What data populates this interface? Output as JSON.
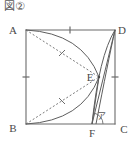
{
  "figure": {
    "caption": "図②",
    "shape": "square",
    "stroke_color": "#6b6b6b",
    "label_color": "#4a4a4a",
    "background": "#ffffff",
    "vertices": [
      {
        "name": "A",
        "label": "A",
        "x": 26,
        "y": 30,
        "label_x": 13,
        "label_y": 32
      },
      {
        "name": "D",
        "label": "D",
        "x": 115,
        "y": 30,
        "label_x": 118,
        "label_y": 32
      },
      {
        "name": "B",
        "label": "B",
        "x": 26,
        "y": 124,
        "label_x": 13,
        "label_y": 132
      },
      {
        "name": "C",
        "label": "C",
        "x": 115,
        "y": 124,
        "label_x": 118,
        "label_y": 132
      }
    ],
    "points": [
      {
        "name": "E",
        "label": "E",
        "x": 99,
        "y": 77,
        "label_x": 86,
        "label_y": 81
      },
      {
        "name": "F",
        "label": "F",
        "x": 92,
        "y": 124,
        "label_x": 88,
        "label_y": 137
      }
    ],
    "angle": {
      "name": "alpha",
      "label": "ア",
      "at_point": "F",
      "label_x": 97,
      "label_y": 118
    },
    "tick_marks": [
      {
        "name": "tick-side-AD",
        "side": "AD",
        "x": 70,
        "y": 30
      },
      {
        "name": "tick-side-AB",
        "side": "AB",
        "x": 26,
        "y": 77
      },
      {
        "name": "tick-side-DC",
        "side": "DC",
        "x": 115,
        "y": 77
      },
      {
        "name": "tick-segment-AE",
        "segment": "AE",
        "x": 62,
        "y": 53
      },
      {
        "name": "tick-segment-BE",
        "segment": "BE",
        "x": 62,
        "y": 101
      }
    ],
    "segments": [
      {
        "name": "side-AD",
        "from": "A",
        "to": "D",
        "style": "solid"
      },
      {
        "name": "side-AB",
        "from": "A",
        "to": "B",
        "style": "solid"
      },
      {
        "name": "side-DC",
        "from": "D",
        "to": "C",
        "style": "solid"
      },
      {
        "name": "side-BC",
        "from": "B",
        "to": "C",
        "style": "solid"
      },
      {
        "name": "segment-AE",
        "from": "A",
        "to": "E",
        "style": "dashed"
      },
      {
        "name": "segment-BE",
        "from": "B",
        "to": "E",
        "style": "dashed"
      },
      {
        "name": "segment-DF",
        "from": "D",
        "to": "F",
        "style": "solid"
      },
      {
        "name": "segment-EF",
        "from": "E",
        "to": "F",
        "style": "solid"
      }
    ],
    "arcs": [
      {
        "name": "arc-A-to-E",
        "from": "A",
        "to": "E",
        "style": "solid"
      },
      {
        "name": "arc-B-to-E",
        "from": "B",
        "to": "E",
        "style": "solid"
      },
      {
        "name": "arc-D-to-E",
        "from": "D",
        "to": "E",
        "style": "solid"
      },
      {
        "name": "arc-E-to-C",
        "from": "E",
        "to": "C",
        "style": "solid"
      }
    ]
  }
}
